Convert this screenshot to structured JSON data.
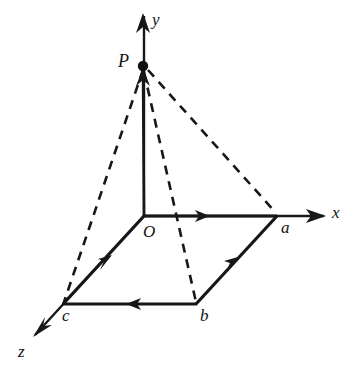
{
  "figure": {
    "background_color": "#ffffff",
    "ink_color": "#171717",
    "axes": [
      {
        "id": "x",
        "label": "x",
        "label_x": 332,
        "label_y": 206,
        "from": [
          144,
          216
        ],
        "to": [
          324,
          216
        ]
      },
      {
        "id": "y",
        "label": "y",
        "label_x": 152,
        "label_y": 12,
        "from": [
          144,
          216
        ],
        "to": [
          144,
          16
        ]
      },
      {
        "id": "z",
        "label": "z",
        "label_x": 18,
        "label_y": 343,
        "from": [
          144,
          216
        ],
        "to": [
          35,
          335
        ]
      }
    ],
    "points": [
      {
        "id": "O",
        "label": "O",
        "x": 144,
        "y": 216,
        "label_x": 143,
        "label_y": 222,
        "dot": false
      },
      {
        "id": "P",
        "label": "P",
        "x": 143,
        "y": 66,
        "label_x": 118,
        "label_y": 52,
        "dot": true
      },
      {
        "id": "a",
        "label": "a",
        "x": 277,
        "y": 216,
        "label_x": 281,
        "label_y": 219,
        "dot": false
      },
      {
        "id": "b",
        "label": "b",
        "x": 196,
        "y": 304,
        "label_x": 200,
        "label_y": 306,
        "dot": false
      },
      {
        "id": "c",
        "label": "c",
        "x": 63,
        "y": 304,
        "label_x": 63,
        "label_y": 306,
        "dot": false
      }
    ],
    "solid_vectors": [
      {
        "id": "O-to-a",
        "from": [
          144,
          216
        ],
        "to": [
          277,
          216
        ],
        "arrow_at": [
          207,
          216
        ],
        "arrow_angle": 0
      },
      {
        "id": "b-to-a",
        "from": [
          196,
          304
        ],
        "to": [
          277,
          216
        ],
        "arrow_at": [
          234,
          263
        ],
        "arrow_angle": -47.4
      },
      {
        "id": "b-to-c",
        "from": [
          196,
          304
        ],
        "to": [
          63,
          304
        ],
        "arrow_at": [
          131,
          304
        ],
        "arrow_angle": 180
      },
      {
        "id": "c-to-O",
        "from": [
          63,
          304
        ],
        "to": [
          144,
          216
        ],
        "arrow_at": [
          108,
          261
        ],
        "arrow_angle": -47.4
      },
      {
        "id": "O-to-P",
        "from": [
          144,
          216
        ],
        "to": [
          143,
          66
        ],
        "arrow_at": [
          143,
          80
        ],
        "arrow_angle": -90
      }
    ],
    "dashed_lines": [
      {
        "id": "P-to-c",
        "from": [
          143,
          68
        ],
        "to": [
          63,
          304
        ]
      },
      {
        "id": "P-to-b",
        "from": [
          143,
          68
        ],
        "to": [
          196,
          304
        ]
      },
      {
        "id": "P-to-a",
        "from": [
          143,
          68
        ],
        "to": [
          277,
          216
        ]
      }
    ],
    "axis_arrowheads": [
      {
        "id": "x-axis-arrowhead",
        "at": [
          324,
          216
        ],
        "angle": 0
      },
      {
        "id": "y-axis-arrowhead",
        "at": [
          144,
          16
        ],
        "angle": -90
      },
      {
        "id": "z-axis-arrowhead",
        "at": [
          35,
          335
        ],
        "angle": 132.5
      }
    ]
  }
}
